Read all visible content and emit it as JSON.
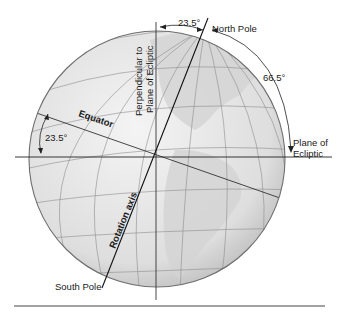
{
  "diagram": {
    "labels": {
      "north_pole": "North Pole",
      "south_pole": "South Pole",
      "equator": "Equator",
      "rotation_axis": "Rotation axis",
      "perpendicular_line1": "Perpendicular to",
      "perpendicular_line2": "Plane of Ecliptic",
      "plane_line1": "Plane of",
      "plane_line2": "Ecliptic",
      "angle_top": "23.5°",
      "angle_left": "23.5°",
      "angle_right": "66.5°"
    },
    "colors": {
      "globe_fill": "#e2e2e2",
      "globe_edge": "#6e6e6e",
      "land": "#cfcfcf",
      "grid": "#8a8a8a",
      "line": "#222222"
    }
  }
}
